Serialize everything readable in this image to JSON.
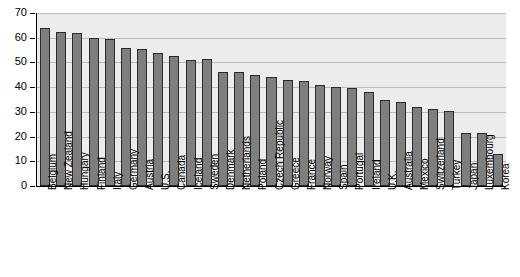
{
  "chart_data": {
    "type": "bar",
    "title": "",
    "subtitle": "",
    "xlabel": "",
    "ylabel": "",
    "ylim": [
      0,
      70
    ],
    "xlim_categories": 30,
    "grid": true,
    "legend": false,
    "legend_position": "none",
    "bar_color": "#7e7e7e",
    "bar_border_color": "#2b2b2b",
    "plot_background": "#ececec",
    "gridline_color": "#b9b9b9",
    "axis_color": "#000000",
    "y_ticks": [
      0,
      10,
      20,
      30,
      40,
      50,
      60,
      70
    ],
    "y_tick_labels": [
      "0",
      "10",
      "20",
      "30",
      "40",
      "50",
      "60",
      "70"
    ],
    "categories": [
      "Belgium",
      "New Zealand",
      "Hungary",
      "Finland",
      "Italy",
      "Germany",
      "Austria",
      "U.S.",
      "Canada",
      "Iceland",
      "Sweden",
      "Denmark",
      "Netherlands",
      "Poland",
      "Czech Republic",
      "Greece",
      "France",
      "Norway",
      "Spain",
      "Portugal",
      "Ireland",
      "U.K.",
      "Australia",
      "Mexico",
      "Switzerland",
      "Turkey",
      "Japan",
      "Luxembourg",
      "Korea"
    ],
    "values": [
      64,
      62.5,
      62,
      60,
      59.5,
      56,
      55.5,
      54,
      52.5,
      51,
      51.5,
      46,
      46,
      45,
      44,
      43,
      42.5,
      41,
      40,
      39.5,
      38,
      35,
      34,
      32,
      31,
      30.5,
      21.5,
      21.5,
      13
    ]
  }
}
